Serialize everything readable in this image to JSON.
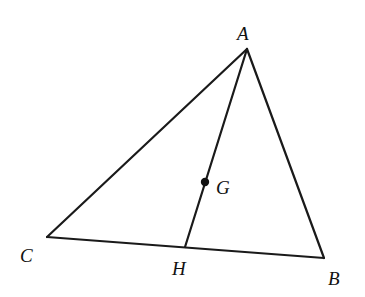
{
  "diagram": {
    "type": "triangle-median",
    "points": {
      "A": {
        "x": 247,
        "y": 49,
        "label": "A",
        "lx": 237,
        "ly": 40
      },
      "B": {
        "x": 324,
        "y": 258,
        "label": "B",
        "lx": 328,
        "ly": 285
      },
      "C": {
        "x": 47,
        "y": 237,
        "label": "C",
        "lx": 20,
        "ly": 262
      },
      "H": {
        "x": 185,
        "y": 247,
        "label": "H",
        "lx": 172,
        "ly": 275
      },
      "G": {
        "x": 205,
        "y": 182,
        "label": "G",
        "lx": 216,
        "ly": 194
      }
    },
    "segments": [
      [
        "A",
        "B"
      ],
      [
        "B",
        "C"
      ],
      [
        "C",
        "A"
      ],
      [
        "A",
        "H"
      ]
    ],
    "stroke_color": "#1a1a1a"
  }
}
